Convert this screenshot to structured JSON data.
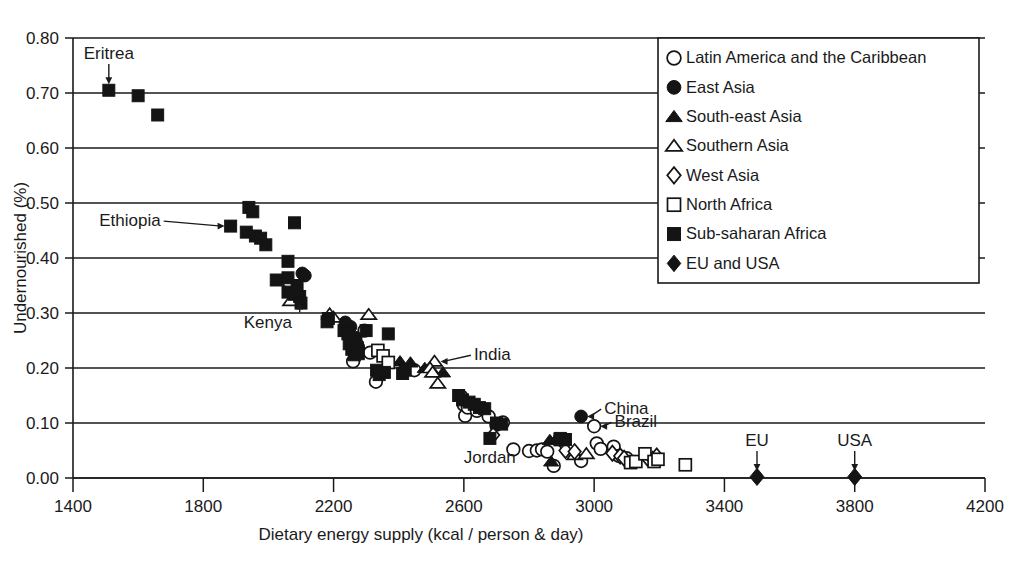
{
  "chart_data": {
    "type": "scatter",
    "title": "",
    "xlabel": "Dietary energy supply (kcal / person & day)",
    "ylabel": "Undernourished (%)",
    "xlim": [
      1400,
      4200
    ],
    "ylim": [
      0.0,
      0.8
    ],
    "xticks": [
      1400,
      1800,
      2200,
      2600,
      3000,
      3400,
      3800,
      4200
    ],
    "xtick_labels": [
      "1400",
      "1800",
      "2200",
      "2600",
      "3000",
      "3400",
      "3800",
      "4200"
    ],
    "yticks": [
      0.0,
      0.1,
      0.2,
      0.3,
      0.4,
      0.5,
      0.6,
      0.7,
      0.8
    ],
    "ytick_labels": [
      "0.00",
      "0.10",
      "0.20",
      "0.30",
      "0.40",
      "0.50",
      "0.60",
      "0.70",
      "0.80"
    ],
    "grid": "horizontal",
    "legend_position": "top-right",
    "marker_color": "#141414",
    "series": [
      {
        "name": "Latin America and the Caribbean",
        "marker": "circle-open",
        "points": [
          [
            2272,
            0.243
          ],
          [
            2295,
            0.268
          ],
          [
            2260,
            0.212
          ],
          [
            2312,
            0.228
          ],
          [
            2330,
            0.175
          ],
          [
            2448,
            0.196
          ],
          [
            2592,
            0.148
          ],
          [
            2600,
            0.133
          ],
          [
            2604,
            0.113
          ],
          [
            2612,
            0.128
          ],
          [
            2640,
            0.122
          ],
          [
            2676,
            0.112
          ],
          [
            2700,
            0.097
          ],
          [
            2720,
            0.101
          ],
          [
            2752,
            0.052
          ],
          [
            2800,
            0.049
          ],
          [
            2824,
            0.05
          ],
          [
            2840,
            0.052
          ],
          [
            2856,
            0.048
          ],
          [
            2876,
            0.022
          ],
          [
            2960,
            0.031
          ],
          [
            3000,
            0.094
          ],
          [
            3008,
            0.063
          ],
          [
            3020,
            0.053
          ],
          [
            3060,
            0.057
          ],
          [
            3076,
            0.04
          ],
          [
            3100,
            0.036
          ]
        ]
      },
      {
        "name": "East Asia",
        "marker": "circle-filled",
        "points": [
          [
            2104,
            0.372
          ],
          [
            2112,
            0.368
          ],
          [
            2236,
            0.283
          ],
          [
            2252,
            0.275
          ],
          [
            2268,
            0.255
          ],
          [
            2276,
            0.238
          ],
          [
            2960,
            0.112
          ]
        ]
      },
      {
        "name": "South-east Asia",
        "marker": "triangle-filled",
        "points": [
          [
            2404,
            0.212
          ],
          [
            2436,
            0.21
          ],
          [
            2480,
            0.2
          ],
          [
            2536,
            0.192
          ],
          [
            2864,
            0.069
          ],
          [
            2884,
            0.072
          ],
          [
            2868,
            0.03
          ],
          [
            2900,
            0.068
          ]
        ]
      },
      {
        "name": "Southern Asia",
        "marker": "triangle-open",
        "points": [
          [
            2068,
            0.322
          ],
          [
            2188,
            0.298
          ],
          [
            2200,
            0.292
          ],
          [
            2308,
            0.297
          ],
          [
            2510,
            0.212
          ],
          [
            2496,
            0.2
          ],
          [
            2504,
            0.192
          ],
          [
            2520,
            0.172
          ],
          [
            2940,
            0.042
          ],
          [
            2976,
            0.044
          ]
        ]
      },
      {
        "name": "West Asia",
        "marker": "diamond-open",
        "points": [
          [
            2064,
            0.352
          ],
          [
            2690,
            0.078
          ],
          [
            2908,
            0.062
          ],
          [
            2912,
            0.05
          ],
          [
            2940,
            0.048
          ],
          [
            3056,
            0.045
          ],
          [
            3080,
            0.04
          ],
          [
            3092,
            0.036
          ],
          [
            3164,
            0.036
          ],
          [
            3180,
            0.034
          ],
          [
            3192,
            0.04
          ]
        ]
      },
      {
        "name": "North Africa",
        "marker": "square-open",
        "points": [
          [
            2336,
            0.232
          ],
          [
            2352,
            0.222
          ],
          [
            2368,
            0.21
          ],
          [
            2896,
            0.07
          ],
          [
            3112,
            0.028
          ],
          [
            3128,
            0.03
          ],
          [
            3156,
            0.044
          ],
          [
            3184,
            0.03
          ],
          [
            3196,
            0.034
          ],
          [
            3280,
            0.024
          ]
        ]
      },
      {
        "name": "Sub-saharan Africa",
        "marker": "square-filled",
        "points": [
          [
            1510,
            0.705
          ],
          [
            1600,
            0.695
          ],
          [
            1660,
            0.66
          ],
          [
            1884,
            0.458
          ],
          [
            1940,
            0.492
          ],
          [
            1952,
            0.484
          ],
          [
            1932,
            0.447
          ],
          [
            1960,
            0.44
          ],
          [
            1976,
            0.436
          ],
          [
            1992,
            0.424
          ],
          [
            2080,
            0.464
          ],
          [
            2060,
            0.394
          ],
          [
            2060,
            0.364
          ],
          [
            2024,
            0.36
          ],
          [
            2060,
            0.338
          ],
          [
            2080,
            0.334
          ],
          [
            2096,
            0.33
          ],
          [
            2100,
            0.318
          ],
          [
            2088,
            0.35
          ],
          [
            2184,
            0.29
          ],
          [
            2180,
            0.284
          ],
          [
            2232,
            0.268
          ],
          [
            2244,
            0.262
          ],
          [
            2248,
            0.244
          ],
          [
            2256,
            0.234
          ],
          [
            2264,
            0.224
          ],
          [
            2276,
            0.226
          ],
          [
            2300,
            0.268
          ],
          [
            2368,
            0.262
          ],
          [
            2332,
            0.196
          ],
          [
            2340,
            0.188
          ],
          [
            2356,
            0.192
          ],
          [
            2412,
            0.19
          ],
          [
            2420,
            0.196
          ],
          [
            2584,
            0.15
          ],
          [
            2596,
            0.142
          ],
          [
            2616,
            0.138
          ],
          [
            2632,
            0.134
          ],
          [
            2648,
            0.128
          ],
          [
            2664,
            0.126
          ],
          [
            2700,
            0.1
          ],
          [
            2716,
            0.098
          ],
          [
            2680,
            0.072
          ],
          [
            2896,
            0.072
          ],
          [
            2912,
            0.07
          ]
        ]
      },
      {
        "name": "EU and USA",
        "marker": "diamond-filled",
        "points": [
          [
            3500,
            0.002
          ],
          [
            3800,
            0.002
          ]
        ]
      }
    ],
    "annotations": [
      {
        "label": "Eritrea",
        "x": 1510,
        "y": 0.705,
        "text_x": 1530,
        "text_y": 0.762,
        "arrow": "down"
      },
      {
        "label": "Ethiopia",
        "x": 1884,
        "y": 0.458,
        "text_x": 1660,
        "text_y": 0.458,
        "arrow": "right"
      },
      {
        "label": "Kenya",
        "x": 2096,
        "y": 0.33,
        "text_x": 1998,
        "text_y": 0.272,
        "arrow": "up"
      },
      {
        "label": "India",
        "x": 2510,
        "y": 0.212,
        "text_x": 2640,
        "text_y": 0.214,
        "arrow": "left"
      },
      {
        "label": "China",
        "x": 2960,
        "y": 0.112,
        "text_x": 3040,
        "text_y": 0.116,
        "arrow": "left"
      },
      {
        "label": "Brazil",
        "x": 3000,
        "y": 0.094,
        "text_x": 3072,
        "text_y": 0.092,
        "arrow": "left"
      },
      {
        "label": "Jordan",
        "x": 2760,
        "y": 0.04,
        "text_x": 2600,
        "text_y": 0.028,
        "arrow": "none"
      },
      {
        "label": "EU",
        "x": 3500,
        "y": 0.002,
        "text_x": 3500,
        "text_y": 0.058,
        "arrow": "down"
      },
      {
        "label": "USA",
        "x": 3800,
        "y": 0.002,
        "text_x": 3800,
        "text_y": 0.058,
        "arrow": "down"
      }
    ],
    "legend_entries": [
      {
        "label": "Latin America and the Caribbean",
        "marker": "circle-open"
      },
      {
        "label": "East Asia",
        "marker": "circle-filled"
      },
      {
        "label": "South-east Asia",
        "marker": "triangle-filled"
      },
      {
        "label": "Southern Asia",
        "marker": "triangle-open"
      },
      {
        "label": "West Asia",
        "marker": "diamond-open"
      },
      {
        "label": "North Africa",
        "marker": "square-open"
      },
      {
        "label": "Sub-saharan Africa",
        "marker": "square-filled"
      },
      {
        "label": "EU and USA",
        "marker": "diamond-filled"
      }
    ]
  }
}
